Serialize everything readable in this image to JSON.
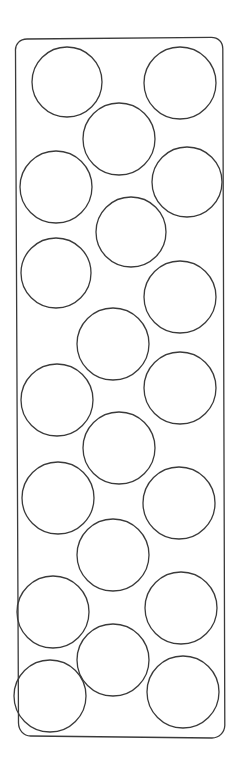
{
  "figure": {
    "title": "Rounded rectangular tray outline with circular wells",
    "canvas": {
      "width": 237,
      "height": 778,
      "background": "#ffffff"
    },
    "style": {
      "stroke_color": "#3a3a3a",
      "stroke_width": 1.3,
      "fill": "none"
    },
    "tray": {
      "name": "tray-outline",
      "description": "Tall vertical rounded-corner quadrilateral, slightly narrower at top than bottom",
      "corner_radius": 12,
      "top_left": {
        "x": 15,
        "y": 39
      },
      "top_right": {
        "x": 223,
        "y": 37
      },
      "bottom_right": {
        "x": 225,
        "y": 737
      },
      "bottom_left": {
        "x": 18,
        "y": 735
      },
      "path": "M 27 39 C 20 39 15 44 15.5 51 L 18.5 723 C 18.6 730 23.5 736 30.5 736 L 212 738 C 219 738 224.5 732.5 224.8 725.5 L 222.8 49 C 222.9 42 218 37.3 211 37.4 Z"
    },
    "circles": [
      {
        "name": "well-1",
        "cx": 67,
        "cy": 82,
        "r": 35
      },
      {
        "name": "well-2",
        "cx": 180,
        "cy": 83,
        "r": 36
      },
      {
        "name": "well-3",
        "cx": 119,
        "cy": 139,
        "r": 36
      },
      {
        "name": "well-4",
        "cx": 56,
        "cy": 187,
        "r": 36
      },
      {
        "name": "well-5",
        "cx": 187,
        "cy": 182,
        "r": 35
      },
      {
        "name": "well-6",
        "cx": 131,
        "cy": 232,
        "r": 35
      },
      {
        "name": "well-7",
        "cx": 56,
        "cy": 273,
        "r": 35
      },
      {
        "name": "well-8",
        "cx": 180,
        "cy": 297,
        "r": 36
      },
      {
        "name": "well-9",
        "cx": 113,
        "cy": 344,
        "r": 36
      },
      {
        "name": "well-10",
        "cx": 57,
        "cy": 400,
        "r": 36
      },
      {
        "name": "well-11",
        "cx": 180,
        "cy": 388,
        "r": 36
      },
      {
        "name": "well-12",
        "cx": 119,
        "cy": 448,
        "r": 36
      },
      {
        "name": "well-13",
        "cx": 58,
        "cy": 498,
        "r": 36
      },
      {
        "name": "well-14",
        "cx": 179,
        "cy": 503,
        "r": 36
      },
      {
        "name": "well-15",
        "cx": 113,
        "cy": 555,
        "r": 36
      },
      {
        "name": "well-16",
        "cx": 53,
        "cy": 612,
        "r": 36
      },
      {
        "name": "well-17",
        "cx": 181,
        "cy": 608,
        "r": 36
      },
      {
        "name": "well-18",
        "cx": 113,
        "cy": 660,
        "r": 36
      },
      {
        "name": "well-19",
        "cx": 50,
        "cy": 696,
        "r": 36
      },
      {
        "name": "well-20",
        "cx": 183,
        "cy": 692,
        "r": 36
      }
    ],
    "circle_count": 20
  }
}
